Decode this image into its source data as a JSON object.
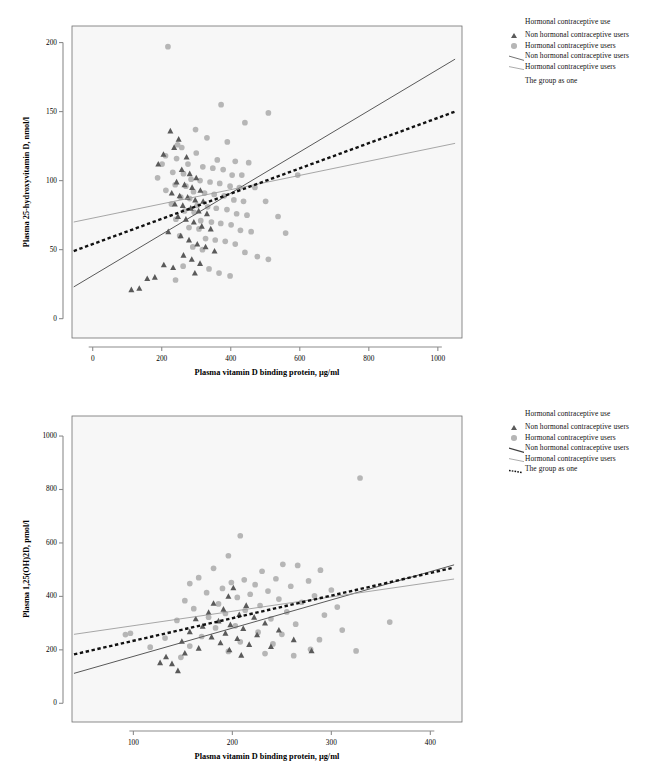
{
  "figure": {
    "background": "#ffffff",
    "plot_bg": "#f7f7f7",
    "panel_count": 2
  },
  "colors": {
    "triangle_marker": "#5a5a5a",
    "circle_marker": "#b6b6b6",
    "line_non_hormonal": "#595959",
    "line_hormonal": "#9d9d9d",
    "line_group": "#111111",
    "axis": "#8c8c8c",
    "frame": "#6f6f6f"
  },
  "legend": {
    "title": "Hormonal contraceptive use",
    "items": [
      {
        "key": "triangle-marker",
        "label": "Non hormonal contraceptive users"
      },
      {
        "key": "circle-marker",
        "label": "Hormonal contraceptive users"
      },
      {
        "key": "solid-dark-line",
        "label": "Non hormonal contraceptive users"
      },
      {
        "key": "solid-light-line",
        "label": "Hormonal contraceptive users"
      },
      {
        "key": "dotted-line",
        "label": "The group as one"
      }
    ]
  },
  "chart_data": [
    {
      "type": "scatter",
      "title": "",
      "xlabel": "Plasma vitamin D binding protein, µg/ml",
      "ylabel": "Plasma 25-hydroxyvitamin D, nmol/l",
      "xlim": [
        -60,
        1070
      ],
      "ylim": [
        -14,
        212
      ],
      "xticks": [
        0,
        200,
        400,
        600,
        800,
        1000
      ],
      "yticks": [
        0,
        50,
        100,
        150,
        200
      ],
      "grid": false,
      "legend_position": "right",
      "series": [
        {
          "name": "Hormonal contraceptive users",
          "marker": "circle",
          "color": "#b6b6b6",
          "points": [
            [
              218,
              197
            ],
            [
              372,
              155
            ],
            [
              509,
              149
            ],
            [
              441,
              142
            ],
            [
              298,
              137
            ],
            [
              331,
              131
            ],
            [
              390,
              128
            ],
            [
              246,
              126
            ],
            [
              258,
              124
            ],
            [
              300,
              120
            ],
            [
              211,
              118
            ],
            [
              243,
              116
            ],
            [
              361,
              115
            ],
            [
              413,
              114
            ],
            [
              452,
              113
            ],
            [
              201,
              112
            ],
            [
              276,
              112
            ],
            [
              319,
              110
            ],
            [
              348,
              109
            ],
            [
              378,
              108
            ],
            [
              232,
              106
            ],
            [
              263,
              105
            ],
            [
              404,
              104
            ],
            [
              432,
              104
            ],
            [
              594,
              104
            ],
            [
              188,
              102
            ],
            [
              285,
              101
            ],
            [
              311,
              100
            ],
            [
              340,
              99
            ],
            [
              368,
              98
            ],
            [
              239,
              97
            ],
            [
              270,
              96
            ],
            [
              398,
              96
            ],
            [
              425,
              95
            ],
            [
              470,
              95
            ],
            [
              212,
              93
            ],
            [
              292,
              92
            ],
            [
              324,
              91
            ],
            [
              352,
              90
            ],
            [
              381,
              89
            ],
            [
              255,
              88
            ],
            [
              281,
              87
            ],
            [
              409,
              86
            ],
            [
              437,
              85
            ],
            [
              501,
              85
            ],
            [
              228,
              83
            ],
            [
              303,
              82
            ],
            [
              333,
              81
            ],
            [
              358,
              80
            ],
            [
              389,
              79
            ],
            [
              266,
              78
            ],
            [
              294,
              77
            ],
            [
              417,
              76
            ],
            [
              447,
              75
            ],
            [
              537,
              74
            ],
            [
              241,
              72
            ],
            [
              313,
              71
            ],
            [
              344,
              70
            ],
            [
              371,
              69
            ],
            [
              401,
              68
            ],
            [
              279,
              66
            ],
            [
              308,
              65
            ],
            [
              428,
              64
            ],
            [
              459,
              63
            ],
            [
              559,
              62
            ],
            [
              252,
              60
            ],
            [
              327,
              58
            ],
            [
              355,
              57
            ],
            [
              384,
              56
            ],
            [
              413,
              54
            ],
            [
              290,
              52
            ],
            [
              318,
              50
            ],
            [
              441,
              48
            ],
            [
              477,
              45
            ],
            [
              509,
              43
            ],
            [
              262,
              38
            ],
            [
              337,
              36
            ],
            [
              366,
              33
            ],
            [
              398,
              31
            ],
            [
              240,
              28
            ]
          ]
        },
        {
          "name": "Non hormonal contraceptive users",
          "marker": "triangle",
          "color": "#5a5a5a",
          "points": [
            [
              225,
              136
            ],
            [
              249,
              130
            ],
            [
              236,
              124
            ],
            [
              205,
              119
            ],
            [
              272,
              117
            ],
            [
              190,
              112
            ],
            [
              258,
              108
            ],
            [
              281,
              105
            ],
            [
              300,
              102
            ],
            [
              243,
              99
            ],
            [
              266,
              97
            ],
            [
              288,
              95
            ],
            [
              312,
              93
            ],
            [
              229,
              91
            ],
            [
              252,
              89
            ],
            [
              275,
              88
            ],
            [
              297,
              86
            ],
            [
              320,
              85
            ],
            [
              238,
              83
            ],
            [
              261,
              82
            ],
            [
              284,
              80
            ],
            [
              307,
              78
            ],
            [
              331,
              76
            ],
            [
              247,
              74
            ],
            [
              270,
              72
            ],
            [
              293,
              70
            ],
            [
              316,
              67
            ],
            [
              342,
              65
            ],
            [
              219,
              63
            ],
            [
              255,
              60
            ],
            [
              279,
              57
            ],
            [
              303,
              54
            ],
            [
              327,
              52
            ],
            [
              353,
              49
            ],
            [
              263,
              46
            ],
            [
              287,
              43
            ],
            [
              311,
              40
            ],
            [
              206,
              39
            ],
            [
              233,
              37
            ],
            [
              296,
              33
            ],
            [
              180,
              30
            ],
            [
              158,
              29
            ],
            [
              135,
              22
            ],
            [
              112,
              21
            ]
          ]
        }
      ],
      "fit_lines": [
        {
          "name": "Non hormonal contraceptive users",
          "style": "solid",
          "color": "#595959",
          "width": 1.0,
          "x1": -55,
          "y1": 23,
          "x2": 1050,
          "y2": 188
        },
        {
          "name": "Hormonal contraceptive users",
          "style": "solid",
          "color": "#9d9d9d",
          "width": 0.9,
          "x1": -55,
          "y1": 70,
          "x2": 1050,
          "y2": 127
        },
        {
          "name": "The group as one",
          "style": "dotted",
          "color": "#111111",
          "width": 2.4,
          "x1": -55,
          "y1": 49,
          "x2": 1050,
          "y2": 150
        }
      ]
    },
    {
      "type": "scatter",
      "title": "",
      "xlabel": "Plasma vitamin D binding protein, µg/ml",
      "ylabel": "Plasma 1,25(OH)2D, pmol/l",
      "xlim": [
        38,
        432
      ],
      "ylim": [
        -70,
        1075
      ],
      "xticks": [
        100,
        200,
        300,
        400
      ],
      "yticks": [
        0,
        200,
        400,
        600,
        800,
        1000
      ],
      "grid": false,
      "legend_position": "right",
      "series": [
        {
          "name": "Hormonal contraceptive users",
          "marker": "circle",
          "color": "#b6b6b6",
          "points": [
            [
              329,
              843
            ],
            [
              208,
              627
            ],
            [
              196,
              552
            ],
            [
              251,
              520
            ],
            [
              266,
              516
            ],
            [
              181,
              505
            ],
            [
              289,
              498
            ],
            [
              230,
              494
            ],
            [
              166,
              470
            ],
            [
              244,
              466
            ],
            [
              212,
              462
            ],
            [
              277,
              458
            ],
            [
              199,
              452
            ],
            [
              157,
              448
            ],
            [
              223,
              444
            ],
            [
              259,
              438
            ],
            [
              190,
              430
            ],
            [
              300,
              424
            ],
            [
              236,
              420
            ],
            [
              174,
              414
            ],
            [
              218,
              408
            ],
            [
              283,
              402
            ],
            [
              205,
              396
            ],
            [
              247,
              390
            ],
            [
              152,
              384
            ],
            [
              270,
              378
            ],
            [
              186,
              372
            ],
            [
              228,
              366
            ],
            [
              306,
              360
            ],
            [
              161,
              354
            ],
            [
              213,
              348
            ],
            [
              255,
              342
            ],
            [
              193,
              336
            ],
            [
              293,
              330
            ],
            [
              176,
              322
            ],
            [
              239,
              316
            ],
            [
              144,
              310
            ],
            [
              359,
              304
            ],
            [
              264,
              296
            ],
            [
              203,
              290
            ],
            [
              183,
              282
            ],
            [
              311,
              274
            ],
            [
              226,
              266
            ],
            [
              250,
              258
            ],
            [
              169,
              250
            ],
            [
              132,
              244
            ],
            [
              288,
              238
            ],
            [
              208,
              230
            ],
            [
              241,
              222
            ],
            [
              157,
              214
            ],
            [
              117,
              210
            ],
            [
              279,
              202
            ],
            [
              196,
              194
            ],
            [
              233,
              186
            ],
            [
              97,
              262
            ],
            [
              92,
              257
            ],
            [
              325,
              196
            ],
            [
              262,
              178
            ],
            [
              148,
              172
            ]
          ]
        },
        {
          "name": "Non hormonal contraceptive users",
          "marker": "triangle",
          "color": "#5a5a5a",
          "points": [
            [
              201,
              432
            ],
            [
              196,
              400
            ],
            [
              181,
              374
            ],
            [
              214,
              366
            ],
            [
              191,
              352
            ],
            [
              176,
              340
            ],
            [
              207,
              332
            ],
            [
              222,
              322
            ],
            [
              163,
              316
            ],
            [
              186,
              308
            ],
            [
              233,
              300
            ],
            [
              198,
              294
            ],
            [
              170,
              288
            ],
            [
              211,
              280
            ],
            [
              247,
              274
            ],
            [
              157,
              268
            ],
            [
              193,
              262
            ],
            [
              225,
              256
            ],
            [
              179,
              248
            ],
            [
              205,
              242
            ],
            [
              262,
              238
            ],
            [
              149,
              232
            ],
            [
              188,
              226
            ],
            [
              217,
              220
            ],
            [
              239,
              212
            ],
            [
              166,
              206
            ],
            [
              197,
              200
            ],
            [
              280,
              196
            ],
            [
              152,
              188
            ],
            [
              209,
              180
            ],
            [
              133,
              174
            ],
            [
              127,
              152
            ],
            [
              139,
              148
            ],
            [
              145,
              122
            ]
          ]
        }
      ],
      "fit_lines": [
        {
          "name": "Non hormonal contraceptive users",
          "style": "solid",
          "color": "#595959",
          "width": 1.0,
          "x1": 40,
          "y1": 112,
          "x2": 424,
          "y2": 518
        },
        {
          "name": "Hormonal contraceptive users",
          "style": "solid",
          "color": "#9d9d9d",
          "width": 0.9,
          "x1": 40,
          "y1": 258,
          "x2": 424,
          "y2": 465
        },
        {
          "name": "The group as one",
          "style": "dotted",
          "color": "#111111",
          "width": 2.4,
          "x1": 40,
          "y1": 183,
          "x2": 424,
          "y2": 508
        }
      ]
    }
  ]
}
